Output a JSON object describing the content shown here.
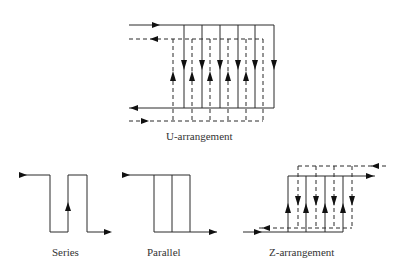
{
  "diagram": {
    "labels": {
      "u": "U-arrangement",
      "series": "Series",
      "parallel": "Parallel",
      "z": "Z-arrangement"
    },
    "colors": {
      "line": "#2a2a2a",
      "arrow": "#111111",
      "text": "#333333",
      "background": "#ffffff"
    },
    "u_arrangement": {
      "solid_channels": 6,
      "dashed_channels": 6
    },
    "series": {
      "passes": 3
    },
    "parallel": {
      "channels": 3
    },
    "z_arrangement": {
      "solid_channels": 4,
      "dashed_channels": 4
    }
  }
}
